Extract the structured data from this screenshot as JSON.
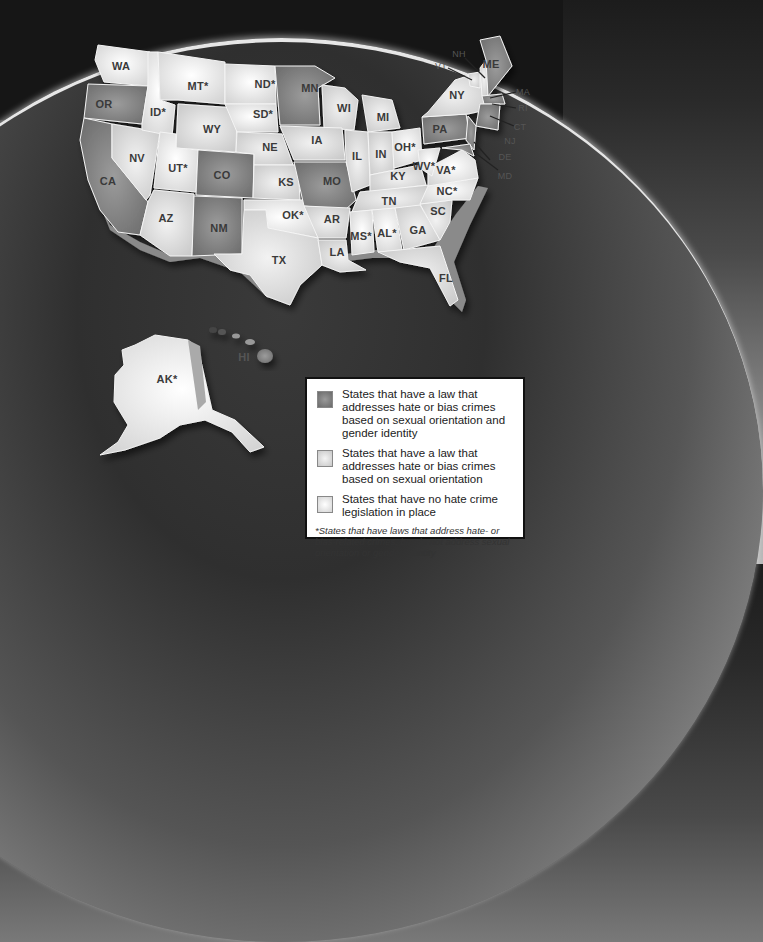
{
  "legend": {
    "items": [
      {
        "category": "both",
        "label": "States that have a law that addresses hate or bias crimes based on sexual orientation and gender identity"
      },
      {
        "category": "sexual_orientation",
        "label": "States that have a law that addresses hate or bias crimes based on sexual orientation"
      },
      {
        "category": "none",
        "label": "States that have no hate crime legislation in place"
      }
    ],
    "footnote": "*States that have laws that address hate- or bias-related crimes, but do not address sexual orientation or gender identity"
  },
  "colors": {
    "both": "#7a7a7a",
    "sexual_orientation": "#dcdcdc",
    "none": "#f6f6f6",
    "background_top": "#161616",
    "arc": "#e6e6e6"
  },
  "states": [
    {
      "abbr": "WA",
      "label": "WA",
      "x": 121,
      "y": 66
    },
    {
      "abbr": "OR",
      "label": "OR",
      "x": 112,
      "y": 104
    },
    {
      "abbr": "CA",
      "label": "CA",
      "x": 109,
      "y": 181
    },
    {
      "abbr": "NV",
      "label": "NV",
      "x": 137,
      "y": 158
    },
    {
      "abbr": "ID",
      "label": "ID*",
      "x": 158,
      "y": 112
    },
    {
      "abbr": "MT",
      "label": "MT*",
      "x": 198,
      "y": 86
    },
    {
      "abbr": "WY",
      "label": "WY",
      "x": 212,
      "y": 129
    },
    {
      "abbr": "UT",
      "label": "UT*",
      "x": 178,
      "y": 168
    },
    {
      "abbr": "AZ",
      "label": "AZ",
      "x": 166,
      "y": 218
    },
    {
      "abbr": "CO",
      "label": "CO",
      "x": 222,
      "y": 175
    },
    {
      "abbr": "NM",
      "label": "NM",
      "x": 219,
      "y": 228
    },
    {
      "abbr": "ND",
      "label": "ND*",
      "x": 265,
      "y": 84
    },
    {
      "abbr": "SD",
      "label": "SD*",
      "x": 263,
      "y": 114
    },
    {
      "abbr": "NE",
      "label": "NE",
      "x": 270,
      "y": 147
    },
    {
      "abbr": "KS",
      "label": "KS",
      "x": 286,
      "y": 182
    },
    {
      "abbr": "OK",
      "label": "OK*",
      "x": 293,
      "y": 215
    },
    {
      "abbr": "TX",
      "label": "TX",
      "x": 279,
      "y": 260
    },
    {
      "abbr": "MN",
      "label": "MN",
      "x": 310,
      "y": 88
    },
    {
      "abbr": "IA",
      "label": "IA",
      "x": 317,
      "y": 140
    },
    {
      "abbr": "MO",
      "label": "MO",
      "x": 332,
      "y": 181
    },
    {
      "abbr": "AR",
      "label": "AR",
      "x": 332,
      "y": 219
    },
    {
      "abbr": "LA",
      "label": "LA",
      "x": 337,
      "y": 252
    },
    {
      "abbr": "WI",
      "label": "WI",
      "x": 344,
      "y": 108
    },
    {
      "abbr": "IL",
      "label": "IL",
      "x": 357,
      "y": 156
    },
    {
      "abbr": "MI",
      "label": "MI",
      "x": 383,
      "y": 117
    },
    {
      "abbr": "IN",
      "label": "IN",
      "x": 381,
      "y": 154
    },
    {
      "abbr": "OH",
      "label": "OH*",
      "x": 405,
      "y": 147
    },
    {
      "abbr": "KY",
      "label": "KY",
      "x": 398,
      "y": 176
    },
    {
      "abbr": "TN",
      "label": "TN",
      "x": 389,
      "y": 201
    },
    {
      "abbr": "MS",
      "label": "MS*",
      "x": 361,
      "y": 236
    },
    {
      "abbr": "AL",
      "label": "AL*",
      "x": 387,
      "y": 233
    },
    {
      "abbr": "GA",
      "label": "GA",
      "x": 418,
      "y": 230
    },
    {
      "abbr": "FL",
      "label": "FL",
      "x": 446,
      "y": 278
    },
    {
      "abbr": "SC",
      "label": "SC",
      "x": 438,
      "y": 211
    },
    {
      "abbr": "NC",
      "label": "NC*",
      "x": 447,
      "y": 191
    },
    {
      "abbr": "VA",
      "label": "VA*",
      "x": 446,
      "y": 170
    },
    {
      "abbr": "WV",
      "label": "WV*",
      "x": 424,
      "y": 166
    },
    {
      "abbr": "PA",
      "label": "PA",
      "x": 440,
      "y": 129
    },
    {
      "abbr": "NY",
      "label": "NY",
      "x": 457,
      "y": 95
    },
    {
      "abbr": "ME",
      "label": "ME",
      "x": 489,
      "y": 64
    },
    {
      "abbr": "AK",
      "label": "AK*",
      "x": 167,
      "y": 379
    },
    {
      "abbr": "HI",
      "label": "HI",
      "x": 243,
      "y": 357
    }
  ],
  "callouts": [
    {
      "abbr": "NH",
      "label": "NH",
      "x": 459,
      "y": 54
    },
    {
      "abbr": "VT",
      "label": "VT",
      "x": 441,
      "y": 66
    },
    {
      "abbr": "MA",
      "label": "MA",
      "x": 521,
      "y": 92
    },
    {
      "abbr": "RI",
      "label": "RI",
      "x": 523,
      "y": 108
    },
    {
      "abbr": "CT",
      "label": "CT",
      "x": 520,
      "y": 127
    },
    {
      "abbr": "NJ",
      "label": "NJ",
      "x": 510,
      "y": 141
    },
    {
      "abbr": "DE",
      "label": "DE",
      "x": 505,
      "y": 157
    },
    {
      "abbr": "MD",
      "label": "MD",
      "x": 505,
      "y": 176
    }
  ]
}
